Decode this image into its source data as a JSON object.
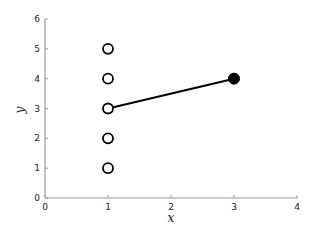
{
  "chart_data": {
    "type": "scatter",
    "title": "",
    "xlabel": "x",
    "ylabel": "y",
    "xlim": [
      0,
      4
    ],
    "ylim": [
      0,
      6
    ],
    "xticks": [
      0,
      1,
      2,
      3,
      4
    ],
    "yticks": [
      0,
      1,
      2,
      3,
      4,
      5,
      6
    ],
    "grid": false,
    "legend": null,
    "series": [
      {
        "name": "open-points",
        "marker": "open-circle",
        "points": [
          [
            1,
            1
          ],
          [
            1,
            2
          ],
          [
            1,
            3
          ],
          [
            1,
            4
          ],
          [
            1,
            5
          ]
        ]
      },
      {
        "name": "filled-point",
        "marker": "filled-circle",
        "points": [
          [
            3,
            4
          ]
        ]
      },
      {
        "name": "segment",
        "type": "line",
        "points": [
          [
            1,
            3
          ],
          [
            3,
            4
          ]
        ]
      }
    ],
    "colors": {
      "axis": "#999999",
      "marker": "#000000",
      "line": "#000000"
    }
  }
}
